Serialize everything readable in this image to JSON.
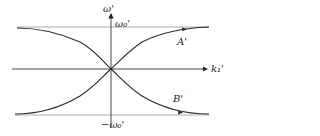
{
  "diagram": {
    "title": "",
    "axes": {
      "x_label": "k₁'",
      "y_label": "ω'",
      "y_top_label": "ω₀'",
      "y_bottom_label": "−ω₀'"
    },
    "curves": [
      {
        "name": "A'",
        "label": "A'",
        "description": "rises from −ω₀' asymptote on the left, through origin, to +ω₀' asymptote on the right"
      },
      {
        "name": "B'",
        "label": "B'",
        "description": "falls from +ω₀' asymptote on the left, through origin, to −ω₀' asymptote on the right"
      }
    ],
    "asymptotes": [
      "ω' = ω₀'",
      "ω' = −ω₀'"
    ],
    "colors": {
      "curve": "#2a2a2a",
      "axis": "#333333",
      "asymptote": "#9a9a9a",
      "background": "#ffffff"
    }
  }
}
